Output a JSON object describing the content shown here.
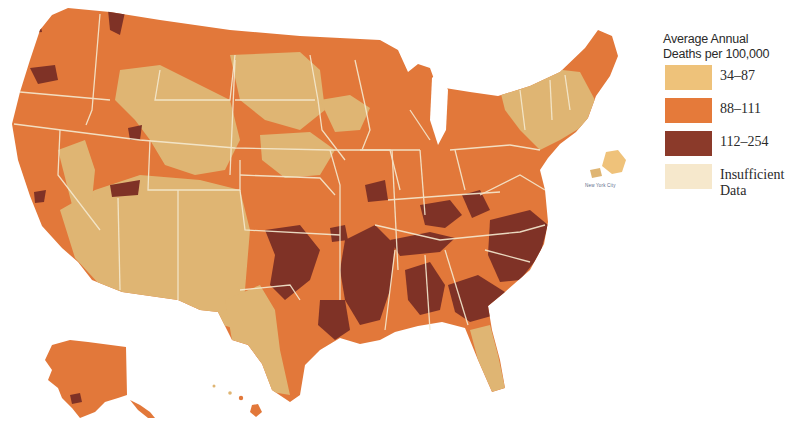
{
  "legend": {
    "title_line1": "Average Annual",
    "title_line2": "Deaths per 100,000",
    "items": [
      {
        "label": "34–87",
        "color": "#eec27a"
      },
      {
        "label": "88–111",
        "color": "#e57a3a"
      },
      {
        "label": "112–254",
        "color": "#8b3a2a"
      },
      {
        "label_line1": "Insufficient",
        "label_line2": "Data",
        "color": "#f6e8cc"
      }
    ]
  },
  "inset": {
    "label": "New York City"
  },
  "colors": {
    "low": "#dfb573",
    "mid": "#e2783a",
    "high": "#7f3226",
    "insufficient": "#f3e3c4",
    "border": "#f5ead0"
  }
}
